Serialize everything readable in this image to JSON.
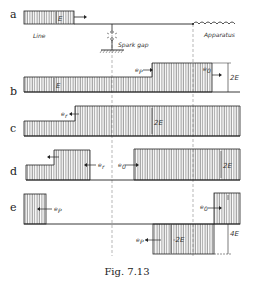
{
  "figure": {
    "caption": "Fig. 7.13",
    "panels": [
      {
        "id": "a",
        "label": "a"
      },
      {
        "id": "b",
        "label": "b"
      },
      {
        "id": "c",
        "label": "c"
      },
      {
        "id": "d",
        "label": "d"
      },
      {
        "id": "e",
        "label": "e"
      }
    ],
    "annotations": {
      "line": "Line",
      "spark_gap": "Spark gap",
      "apparatus": "Apparatus",
      "a_E": "E",
      "b_E": "E",
      "b_2E": "2E",
      "b_ep": "e",
      "b_ep_sub": "P",
      "b_eo": "e",
      "b_eo_sub": "0",
      "c_er": "e",
      "c_er_sub": "r",
      "c_2E": "2E",
      "d_er": "e",
      "d_er_sub": "r",
      "d_eo": "e",
      "d_eo_sub": "0",
      "d_2E": "2E",
      "e_ep_left": "e",
      "e_ep_left_sub": "P",
      "e_eo": "e",
      "e_eo_sub": "0",
      "e_ep_bottom": "e",
      "e_ep_bottom_sub": "P",
      "e_neg2E": "-2E",
      "e_4E": "4E"
    }
  }
}
